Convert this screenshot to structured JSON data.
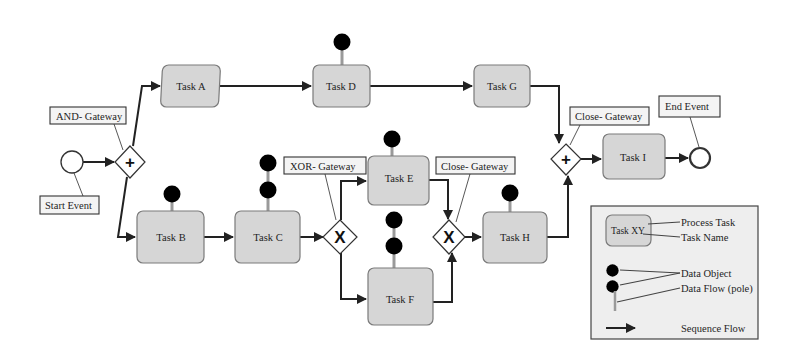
{
  "diagram": {
    "type": "BPMN process model",
    "events": {
      "start": {
        "label": "Start Event"
      },
      "end": {
        "label": "End Event"
      }
    },
    "gateways": {
      "and_split": {
        "label": "AND- Gateway",
        "symbol": "+"
      },
      "xor_split": {
        "label": "XOR- Gateway",
        "symbol": "X"
      },
      "xor_join": {
        "label": "Close- Gateway",
        "symbol": "X"
      },
      "and_join": {
        "label": "Close- Gateway",
        "symbol": "+"
      }
    },
    "tasks": {
      "a": {
        "label": "Task A",
        "data_objects": 0
      },
      "b": {
        "label": "Task B",
        "data_objects": 1
      },
      "c": {
        "label": "Task C",
        "data_objects": 2
      },
      "d": {
        "label": "Task D",
        "data_objects": 1
      },
      "e": {
        "label": "Task E",
        "data_objects": 1
      },
      "f": {
        "label": "Task F",
        "data_objects": 2
      },
      "g": {
        "label": "Task G",
        "data_objects": 0
      },
      "h": {
        "label": "Task H",
        "data_objects": 1
      },
      "i": {
        "label": "Task I",
        "data_objects": 0
      }
    },
    "sequence_flows": [
      [
        "Start Event",
        "AND- Gateway"
      ],
      [
        "AND- Gateway",
        "Task A"
      ],
      [
        "AND- Gateway",
        "Task B"
      ],
      [
        "Task A",
        "Task D"
      ],
      [
        "Task D",
        "Task G"
      ],
      [
        "Task G",
        "Close- Gateway (AND)"
      ],
      [
        "Task B",
        "Task C"
      ],
      [
        "Task C",
        "XOR- Gateway"
      ],
      [
        "XOR- Gateway",
        "Task E"
      ],
      [
        "XOR- Gateway",
        "Task F"
      ],
      [
        "Task E",
        "Close- Gateway (XOR)"
      ],
      [
        "Task F",
        "Close- Gateway (XOR)"
      ],
      [
        "Close- Gateway (XOR)",
        "Task H"
      ],
      [
        "Task H",
        "Close- Gateway (AND)"
      ],
      [
        "Close- Gateway (AND)",
        "Task I"
      ],
      [
        "Task I",
        "End Event"
      ]
    ]
  },
  "legend": {
    "sample_task": "Task XY",
    "process_task": "Process Task",
    "task_name": "Task Name",
    "data_object": "Data Object",
    "data_flow": "Data Flow (pole)",
    "sequence_flow": "Sequence Flow"
  },
  "colors": {
    "task_fill": "#d6d6d6",
    "data_object_fill": "#9e9e9e",
    "line": "#222222",
    "legend_fill": "#eeeeee"
  }
}
